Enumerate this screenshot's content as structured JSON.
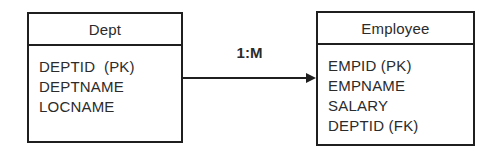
{
  "diagram": {
    "background": "#ffffff",
    "line_color": "#1f1f1f",
    "text_color": "#2b2b2b",
    "entities": [
      {
        "name": "Dept",
        "fields": [
          "DEPTID  (PK)",
          "DEPTNAME",
          "LOCNAME"
        ]
      },
      {
        "name": "Employee",
        "fields": [
          "EMPID (PK)",
          "EMPNAME",
          "SALARY",
          "DEPTID (FK)"
        ]
      }
    ],
    "relationship": {
      "label": "1:M",
      "from": "Dept",
      "to": "Employee",
      "arrow_direction": "right"
    }
  }
}
